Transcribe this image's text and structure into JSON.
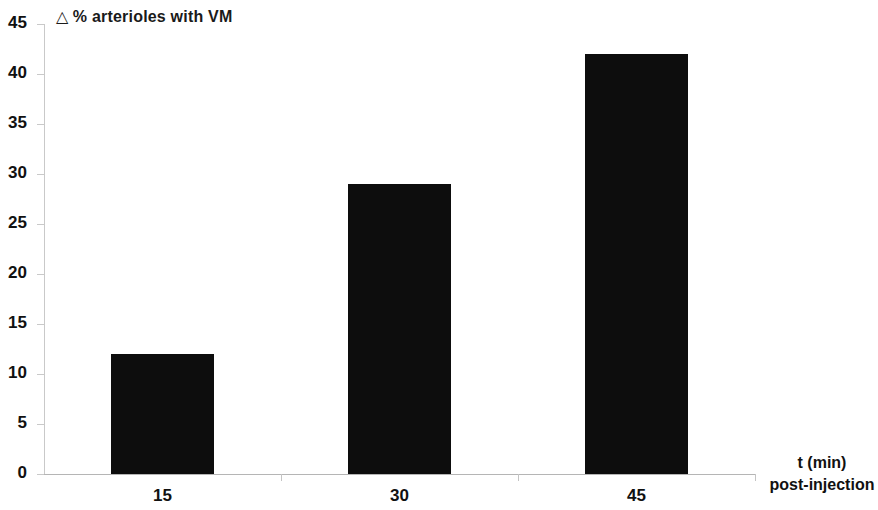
{
  "chart_data": {
    "type": "bar",
    "title": "△ % arterioles with VM",
    "title_symbol": "△",
    "title_text": "% arterioles with VM",
    "categories": [
      "15",
      "30",
      "45"
    ],
    "values": [
      12,
      29,
      42
    ],
    "series": [
      {
        "name": "Δ % arterioles with VM",
        "values": [
          12,
          29,
          42
        ]
      }
    ],
    "xlabel": "t (min) post-injection",
    "xlabel_line1": "t (min)",
    "xlabel_line2": "post-injection",
    "ylabel": "",
    "ylim": [
      0,
      45
    ],
    "ytick_interval": 5,
    "yticks": [
      "45",
      "40",
      "35",
      "30",
      "25",
      "20",
      "15",
      "10",
      "5",
      "0"
    ],
    "ytick_values": [
      45,
      40,
      35,
      30,
      25,
      20,
      15,
      10,
      5,
      0
    ],
    "grid": false,
    "legend": "none",
    "bar_color": "#0d0d0d",
    "axis_color": "#c0c0c0",
    "background_color": "#ffffff"
  }
}
